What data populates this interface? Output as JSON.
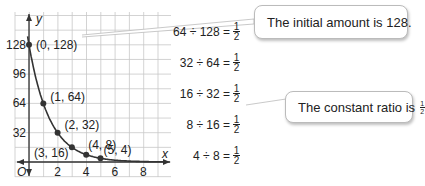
{
  "chart_data": {
    "type": "scatter",
    "title": "",
    "xlabel": "x",
    "ylabel": "y",
    "origin_label": "O",
    "x": [
      0,
      1,
      2,
      3,
      4,
      5
    ],
    "y": [
      128,
      64,
      32,
      16,
      8,
      4
    ],
    "point_labels": [
      "(0, 128)",
      "(1, 64)",
      "(2, 32)",
      "(3, 16)",
      "(4, 8)",
      "(5, 4)"
    ],
    "x_ticks": [
      "2",
      "4",
      "6",
      "8"
    ],
    "y_ticks": [
      "32",
      "64",
      "96",
      "128"
    ],
    "xlim": [
      0,
      9
    ],
    "ylim": [
      0,
      140
    ],
    "grid": true,
    "curve": "exponential decay y = 128(1/2)^x"
  },
  "equations": [
    {
      "lhs": "64 ÷ 128 =",
      "num": "1",
      "den": "2"
    },
    {
      "lhs": "32 ÷ 64 =",
      "num": "1",
      "den": "2"
    },
    {
      "lhs": "16 ÷ 32 =",
      "num": "1",
      "den": "2"
    },
    {
      "lhs": "8 ÷ 16 =",
      "num": "1",
      "den": "2"
    },
    {
      "lhs": "4 ÷ 8 =",
      "num": "1",
      "den": "2"
    }
  ],
  "callouts": {
    "initial": "The initial amount is 128.",
    "ratio_prefix": "The constant ratio is ",
    "ratio_num": "1",
    "ratio_den": "2",
    "ratio_suffix": "."
  }
}
